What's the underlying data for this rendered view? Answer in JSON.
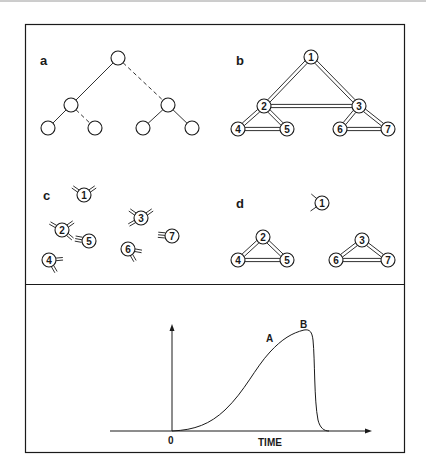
{
  "colors": {
    "ink": "#1a1a1a",
    "paper": "#ffffff",
    "top_rule": "#9a9a9a"
  },
  "panels": {
    "a": {
      "label": "a",
      "nodes": [
        {
          "id": "root",
          "x": 118,
          "y": 58
        },
        {
          "id": "L",
          "x": 71,
          "y": 105
        },
        {
          "id": "R",
          "x": 168,
          "y": 105
        },
        {
          "id": "LL",
          "x": 48,
          "y": 128
        },
        {
          "id": "LR",
          "x": 95,
          "y": 128
        },
        {
          "id": "RL",
          "x": 143,
          "y": 128
        },
        {
          "id": "RR",
          "x": 192,
          "y": 128
        }
      ],
      "edges": [
        {
          "from": "root",
          "to": "L",
          "style": "solid"
        },
        {
          "from": "root",
          "to": "R",
          "style": "dashed"
        },
        {
          "from": "L",
          "to": "LL",
          "style": "solid"
        },
        {
          "from": "L",
          "to": "LR",
          "style": "dashed"
        },
        {
          "from": "R",
          "to": "RL",
          "style": "solid"
        },
        {
          "from": "R",
          "to": "RR",
          "style": "solid"
        }
      ]
    },
    "b": {
      "label": "b",
      "nodes": [
        {
          "id": "1",
          "label": "1",
          "x": 311,
          "y": 57
        },
        {
          "id": "2",
          "label": "2",
          "x": 264,
          "y": 106
        },
        {
          "id": "3",
          "label": "3",
          "x": 359,
          "y": 106
        },
        {
          "id": "4",
          "label": "4",
          "x": 238,
          "y": 129
        },
        {
          "id": "5",
          "label": "5",
          "x": 287,
          "y": 129
        },
        {
          "id": "6",
          "label": "6",
          "x": 340,
          "y": 129
        },
        {
          "id": "7",
          "label": "7",
          "x": 388,
          "y": 129
        }
      ],
      "edges": [
        [
          "1",
          "2"
        ],
        [
          "1",
          "3"
        ],
        [
          "2",
          "3"
        ],
        [
          "2",
          "4"
        ],
        [
          "2",
          "5"
        ],
        [
          "4",
          "5"
        ],
        [
          "3",
          "6"
        ],
        [
          "3",
          "7"
        ],
        [
          "6",
          "7"
        ]
      ]
    },
    "c": {
      "label": "c",
      "nodes": [
        {
          "id": "1",
          "label": "1",
          "x": 84,
          "y": 195,
          "receptors": [
            {
              "angle": 145,
              "n": 2
            },
            {
              "angle": 35,
              "n": 2
            }
          ]
        },
        {
          "id": "2",
          "label": "2",
          "x": 62,
          "y": 230,
          "receptors": [
            {
              "angle": -40,
              "n": 2
            },
            {
              "angle": 150,
              "n": 2
            },
            {
              "angle": 35,
              "n": 2
            }
          ]
        },
        {
          "id": "5",
          "label": "5",
          "x": 89,
          "y": 241,
          "receptors": [
            {
              "angle": 170,
              "n": 3
            }
          ]
        },
        {
          "id": "4",
          "label": "4",
          "x": 49,
          "y": 260,
          "receptors": [
            {
              "angle": -60,
              "n": 2
            },
            {
              "angle": 5,
              "n": 2
            }
          ]
        },
        {
          "id": "3",
          "label": "3",
          "x": 141,
          "y": 218,
          "receptors": [
            {
              "angle": 210,
              "n": 2
            },
            {
              "angle": 145,
              "n": 2
            },
            {
              "angle": 35,
              "n": 2
            }
          ]
        },
        {
          "id": "6",
          "label": "6",
          "x": 128,
          "y": 249,
          "receptors": [
            {
              "angle": -60,
              "n": 2
            },
            {
              "angle": -10,
              "n": 2
            }
          ]
        },
        {
          "id": "7",
          "label": "7",
          "x": 172,
          "y": 236,
          "receptors": [
            {
              "angle": 175,
              "n": 3
            }
          ]
        }
      ]
    },
    "d": {
      "label": "d",
      "nodes": [
        {
          "id": "1",
          "label": "1",
          "x": 322,
          "y": 203,
          "receptors": [
            {
              "angle": 215,
              "n": 1
            },
            {
              "angle": 140,
              "n": 1
            }
          ]
        },
        {
          "id": "2",
          "label": "2",
          "x": 263,
          "y": 237
        },
        {
          "id": "4",
          "label": "4",
          "x": 238,
          "y": 260
        },
        {
          "id": "5",
          "label": "5",
          "x": 287,
          "y": 260
        },
        {
          "id": "3",
          "label": "3",
          "x": 362,
          "y": 240
        },
        {
          "id": "6",
          "label": "6",
          "x": 336,
          "y": 260
        },
        {
          "id": "7",
          "label": "7",
          "x": 388,
          "y": 260
        }
      ],
      "edges": [
        [
          "2",
          "4"
        ],
        [
          "2",
          "5"
        ],
        [
          "4",
          "5"
        ],
        [
          "3",
          "6"
        ],
        [
          "3",
          "7"
        ],
        [
          "6",
          "7"
        ]
      ]
    }
  },
  "graph": {
    "origin_label": "0",
    "x_axis_label": "TIME",
    "point_a_label": "A",
    "point_b_label": "B",
    "description": "Sigmoidal rise from origin to a peak at B, followed by a steep fall back to baseline"
  }
}
